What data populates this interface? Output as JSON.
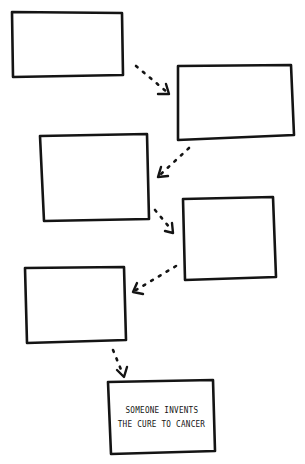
{
  "diagram": {
    "type": "flowchart",
    "style": "hand-drawn",
    "stroke_color": "#141414",
    "background": "#ffffff",
    "nodes": [
      {
        "id": "step-1",
        "text": ""
      },
      {
        "id": "step-2",
        "text": ""
      },
      {
        "id": "step-3",
        "text": ""
      },
      {
        "id": "step-4",
        "text": ""
      },
      {
        "id": "step-5",
        "text": ""
      },
      {
        "id": "outcome",
        "lines": [
          "SOMEONE INVENTS",
          "THE CURE TO CANCER"
        ]
      }
    ],
    "edges": [
      {
        "from": "step-1",
        "to": "step-2",
        "style": "dotted-arrow"
      },
      {
        "from": "step-2",
        "to": "step-3",
        "style": "dotted-arrow"
      },
      {
        "from": "step-3",
        "to": "step-4",
        "style": "dotted-arrow"
      },
      {
        "from": "step-4",
        "to": "step-5",
        "style": "dotted-arrow"
      },
      {
        "from": "step-5",
        "to": "outcome",
        "style": "dotted-arrow"
      }
    ]
  }
}
